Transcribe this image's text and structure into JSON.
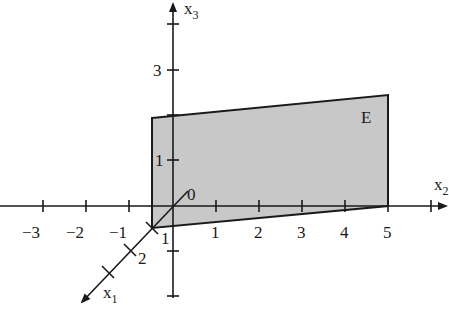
{
  "figure": {
    "type": "3d-coordinate-plane",
    "axes": {
      "x1": {
        "label": "x",
        "subscript": "1",
        "ticks": [
          "1",
          "2"
        ]
      },
      "x2": {
        "label": "x",
        "subscript": "2",
        "ticks": [
          "−3",
          "−2",
          "−1",
          "1",
          "2",
          "3",
          "4",
          "5"
        ]
      },
      "x3": {
        "label": "x",
        "subscript": "3",
        "ticks": [
          "1",
          "3"
        ]
      }
    },
    "origin_label": "0",
    "plane": {
      "label": "E",
      "fill": "#c8c8c8",
      "stroke": "#1a1a1a"
    }
  }
}
